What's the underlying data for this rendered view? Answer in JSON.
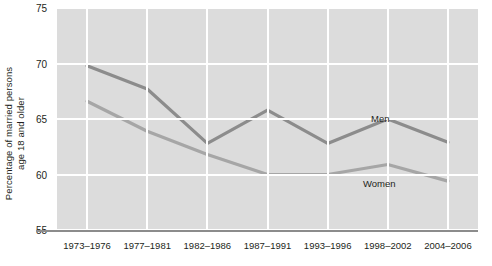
{
  "chart_data": {
    "type": "line",
    "title": "",
    "xlabel": "",
    "ylabel": "Percentage of married persons age 18 and older",
    "ylabel_line1": "Percentage of married persons",
    "ylabel_line2": "age 18 and older",
    "categories": [
      "1973–1976",
      "1977–1981",
      "1982–1986",
      "1987–1991",
      "1993–1996",
      "1998–2002",
      "2004–2006"
    ],
    "ylim": [
      55,
      75
    ],
    "yticks": [
      55,
      60,
      65,
      70,
      75
    ],
    "ytick_labels": [
      "55",
      "60",
      "65",
      "70",
      "75"
    ],
    "grid": true,
    "legend_position": "inline-annotation",
    "series": [
      {
        "name": "Men",
        "color": "#8c8c8c",
        "values": [
          69.8,
          67.7,
          62.8,
          65.8,
          62.8,
          65.0,
          62.9
        ],
        "annotation": "Men"
      },
      {
        "name": "Women",
        "color": "#a6a6a6",
        "values": [
          66.6,
          63.9,
          61.8,
          60.0,
          60.0,
          60.9,
          59.4
        ],
        "annotation": "Women"
      }
    ],
    "plot_background": "#dcdcdc",
    "gridline_color": "#ffffff",
    "axis_color": "#8c8c8c"
  }
}
